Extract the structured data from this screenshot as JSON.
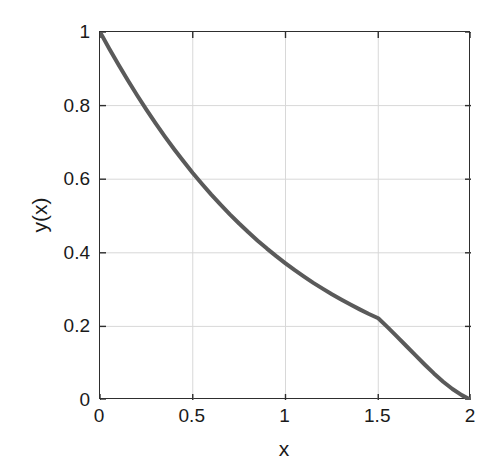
{
  "chart_data": {
    "type": "line",
    "title": "",
    "subtitle": "",
    "xlabel": "x",
    "ylabel": "y(x)",
    "xlim": [
      0,
      2
    ],
    "ylim": [
      0,
      1
    ],
    "xticks": [
      0,
      0.5,
      1,
      1.5,
      2
    ],
    "xtick_labels": [
      "0",
      "0.5",
      "1",
      "1.5",
      "2"
    ],
    "yticks": [
      0,
      0.2,
      0.4,
      0.6,
      0.8,
      1
    ],
    "ytick_labels": [
      "0",
      "0.2",
      "0.4",
      "0.6",
      "0.8",
      "1"
    ],
    "grid": true,
    "legend": null,
    "legend_position": "none",
    "annotations": [],
    "series": [
      {
        "name": "y(x)",
        "color": "#5a5a5a",
        "line_width": 4,
        "x": [
          0,
          0.05,
          0.1,
          0.15,
          0.2,
          0.25,
          0.3,
          0.35,
          0.4,
          0.45,
          0.5,
          0.55,
          0.6,
          0.65,
          0.7,
          0.75,
          0.8,
          0.85,
          0.9,
          0.95,
          1.0,
          1.05,
          1.1,
          1.15,
          1.2,
          1.25,
          1.3,
          1.35,
          1.4,
          1.45,
          1.5,
          1.55,
          1.6,
          1.65,
          1.7,
          1.75,
          1.8,
          1.85,
          1.9,
          1.95,
          2.0
        ],
        "y": [
          1.0,
          0.9546,
          0.9108,
          0.8687,
          0.8281,
          0.7892,
          0.7518,
          0.7159,
          0.6815,
          0.6486,
          0.6171,
          0.587,
          0.5582,
          0.5307,
          0.5045,
          0.4795,
          0.4557,
          0.433,
          0.4114,
          0.3909,
          0.3714,
          0.3528,
          0.3352,
          0.3184,
          0.3025,
          0.2873,
          0.2729,
          0.2592,
          0.2462,
          0.2338,
          0.2221,
          0.198,
          0.173,
          0.1475,
          0.1218,
          0.0965,
          0.0722,
          0.0497,
          0.0298,
          0.0133,
          0.0
        ]
      }
    ],
    "colors": {
      "curve": "#5a5a5a",
      "axis": "#2e2e2e",
      "grid": "#d8d8d8",
      "text": "#1a1a1a",
      "background": "#ffffff"
    }
  }
}
